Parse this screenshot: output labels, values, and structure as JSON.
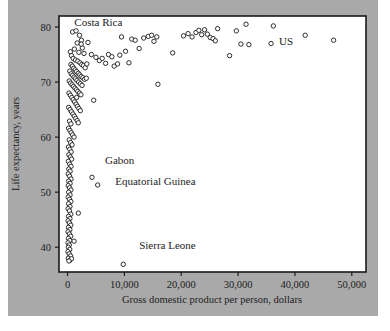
{
  "figure": {
    "background_color": "#ffffff",
    "panel_color": "#a9a9a9",
    "plot_background_color": "#ffffff",
    "frame_color": "#1a1a1a",
    "marker_stroke_color": "#1a1a1a",
    "marker_fill_color": "#ffffff"
  },
  "chart_data": {
    "type": "scatter",
    "title": "",
    "xlabel": "Gross domestic product per person, dollars",
    "ylabel": "Life expectancy, years",
    "xlim": [
      -1500,
      52500
    ],
    "ylim": [
      35.5,
      82.0
    ],
    "xticks": [
      0,
      10000,
      20000,
      30000,
      40000,
      50000
    ],
    "xticklabels": [
      "0",
      "10,000",
      "20,000",
      "30,000",
      "40,000",
      "50,000"
    ],
    "yticks": [
      40,
      50,
      60,
      70,
      80
    ],
    "yticklabels": [
      "40",
      "50",
      "60",
      "70",
      "80"
    ],
    "grid": false,
    "legend": null,
    "annotations": [
      {
        "text": "Costa Rica",
        "x": 1200,
        "y": 80.2,
        "anchor": "start"
      },
      {
        "text": "US",
        "x": 37200,
        "y": 76.7,
        "anchor": "start"
      },
      {
        "text": "Gabon",
        "x": 6600,
        "y": 55.2,
        "anchor": "start"
      },
      {
        "text": "Equatorial Guinea",
        "x": 8400,
        "y": 51.3,
        "anchor": "start"
      },
      {
        "text": "Sierra Leone",
        "x": 12600,
        "y": 39.6,
        "anchor": "start"
      }
    ],
    "points": [
      [
        9500,
        78.2
      ],
      [
        900,
        79.1
      ],
      [
        1500,
        79.3
      ],
      [
        2100,
        78.5
      ],
      [
        2450,
        77.6
      ],
      [
        1700,
        77.1
      ],
      [
        2600,
        76.2
      ],
      [
        1200,
        76.0
      ],
      [
        2000,
        75.4
      ],
      [
        2900,
        75.2
      ],
      [
        500,
        75.5
      ],
      [
        700,
        74.8
      ],
      [
        1000,
        74.3
      ],
      [
        1400,
        74.0
      ],
      [
        1800,
        73.8
      ],
      [
        2200,
        73.5
      ],
      [
        2500,
        73.2
      ],
      [
        2800,
        73.0
      ],
      [
        3100,
        72.6
      ],
      [
        3400,
        73.3
      ],
      [
        600,
        73.2
      ],
      [
        850,
        72.9
      ],
      [
        1100,
        72.5
      ],
      [
        1350,
        72.2
      ],
      [
        1600,
        71.9
      ],
      [
        1900,
        71.6
      ],
      [
        2150,
        71.3
      ],
      [
        2400,
        71.0
      ],
      [
        2700,
        70.8
      ],
      [
        3000,
        70.5
      ],
      [
        400,
        72.0
      ],
      [
        650,
        71.5
      ],
      [
        900,
        71.2
      ],
      [
        1150,
        70.9
      ],
      [
        1400,
        70.6
      ],
      [
        1650,
        70.3
      ],
      [
        1950,
        70.0
      ],
      [
        2250,
        69.7
      ],
      [
        2550,
        69.4
      ],
      [
        3300,
        70.7
      ],
      [
        300,
        70.2
      ],
      [
        550,
        69.8
      ],
      [
        800,
        69.5
      ],
      [
        1050,
        69.2
      ],
      [
        1300,
        68.9
      ],
      [
        1550,
        68.6
      ],
      [
        1800,
        68.3
      ],
      [
        2100,
        68.0
      ],
      [
        2350,
        67.7
      ],
      [
        4600,
        66.7
      ],
      [
        250,
        68.0
      ],
      [
        500,
        67.6
      ],
      [
        750,
        67.2
      ],
      [
        1000,
        66.8
      ],
      [
        1250,
        66.4
      ],
      [
        1500,
        66.0
      ],
      [
        1750,
        65.6
      ],
      [
        2000,
        65.2
      ],
      [
        2250,
        64.8
      ],
      [
        1600,
        67.2
      ],
      [
        200,
        65.4
      ],
      [
        450,
        65.0
      ],
      [
        700,
        64.6
      ],
      [
        950,
        64.2
      ],
      [
        1200,
        63.8
      ],
      [
        1450,
        63.4
      ],
      [
        1700,
        63.0
      ],
      [
        1900,
        62.6
      ],
      [
        350,
        62.9
      ],
      [
        600,
        62.4
      ],
      [
        180,
        61.6
      ],
      [
        420,
        61.2
      ],
      [
        650,
        60.8
      ],
      [
        900,
        60.4
      ],
      [
        1150,
        60.0
      ],
      [
        300,
        59.5
      ],
      [
        550,
        59.0
      ],
      [
        800,
        58.6
      ],
      [
        160,
        58.2
      ],
      [
        400,
        57.8
      ],
      [
        640,
        57.3
      ],
      [
        240,
        56.8
      ],
      [
        480,
        56.4
      ],
      [
        720,
        56.0
      ],
      [
        140,
        55.6
      ],
      [
        380,
        55.1
      ],
      [
        620,
        54.7
      ],
      [
        220,
        54.2
      ],
      [
        460,
        53.8
      ],
      [
        4300,
        52.7
      ],
      [
        130,
        53.3
      ],
      [
        370,
        52.9
      ],
      [
        610,
        52.4
      ],
      [
        5300,
        51.3
      ],
      [
        210,
        52.0
      ],
      [
        450,
        51.6
      ],
      [
        120,
        51.2
      ],
      [
        360,
        50.8
      ],
      [
        600,
        50.4
      ],
      [
        200,
        50.0
      ],
      [
        440,
        49.5
      ],
      [
        110,
        49.1
      ],
      [
        350,
        48.7
      ],
      [
        590,
        48.3
      ],
      [
        190,
        47.9
      ],
      [
        430,
        47.4
      ],
      [
        105,
        47.0
      ],
      [
        340,
        46.6
      ],
      [
        1900,
        46.2
      ],
      [
        580,
        46.0
      ],
      [
        180,
        45.6
      ],
      [
        420,
        45.2
      ],
      [
        100,
        44.8
      ],
      [
        330,
        44.4
      ],
      [
        570,
        44.0
      ],
      [
        170,
        43.6
      ],
      [
        410,
        43.2
      ],
      [
        95,
        42.8
      ],
      [
        320,
        42.4
      ],
      [
        560,
        42.0
      ],
      [
        160,
        41.6
      ],
      [
        400,
        41.2
      ],
      [
        1150,
        41.1
      ],
      [
        90,
        40.8
      ],
      [
        310,
        40.4
      ],
      [
        150,
        40.0
      ],
      [
        390,
        39.6
      ],
      [
        85,
        39.2
      ],
      [
        300,
        38.8
      ],
      [
        540,
        38.4
      ],
      [
        140,
        38.0
      ],
      [
        380,
        37.6
      ],
      [
        9800,
        36.9
      ],
      [
        700,
        37.9
      ],
      [
        250,
        37.5
      ],
      [
        4200,
        75.0
      ],
      [
        5000,
        74.5
      ],
      [
        5600,
        73.9
      ],
      [
        6100,
        74.3
      ],
      [
        6700,
        73.4
      ],
      [
        7200,
        75.0
      ],
      [
        7800,
        74.6
      ],
      [
        8200,
        72.9
      ],
      [
        8800,
        73.3
      ],
      [
        9200,
        74.9
      ],
      [
        10200,
        75.6
      ],
      [
        10800,
        73.5
      ],
      [
        11300,
        77.8
      ],
      [
        11900,
        77.6
      ],
      [
        12600,
        76.1
      ],
      [
        13400,
        78.0
      ],
      [
        14200,
        78.3
      ],
      [
        14800,
        78.5
      ],
      [
        15200,
        77.4
      ],
      [
        15700,
        78.2
      ],
      [
        15900,
        69.6
      ],
      [
        18500,
        75.3
      ],
      [
        20400,
        78.4
      ],
      [
        21200,
        78.8
      ],
      [
        21900,
        78.2
      ],
      [
        22600,
        79.0
      ],
      [
        23100,
        79.4
      ],
      [
        23600,
        78.6
      ],
      [
        24100,
        79.5
      ],
      [
        24600,
        78.7
      ],
      [
        25100,
        78.1
      ],
      [
        25600,
        77.9
      ],
      [
        26000,
        77.5
      ],
      [
        26400,
        79.7
      ],
      [
        28500,
        74.8
      ],
      [
        29700,
        79.3
      ],
      [
        30500,
        76.9
      ],
      [
        31400,
        80.5
      ],
      [
        31900,
        76.8
      ],
      [
        35800,
        77.0
      ],
      [
        36200,
        80.2
      ],
      [
        41800,
        78.5
      ],
      [
        46800,
        77.6
      ],
      [
        3600,
        77.2
      ],
      [
        2400,
        76.9
      ]
    ]
  },
  "labels": {
    "xaxis_title": "Gross domestic product per person, dollars",
    "yaxis_title": "Life expectancy, years"
  }
}
